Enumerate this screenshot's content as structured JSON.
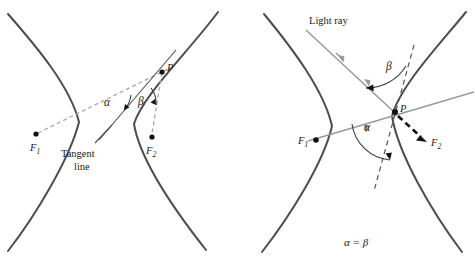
{
  "figure": {
    "width": 475,
    "height": 267,
    "background_color": "#ffffff"
  },
  "colors": {
    "curve": "#4d4d4d",
    "dashed_gray": "#a8a8a8",
    "dashed_dark": "#555555",
    "light_ray": "#9a9a9a",
    "reflected_ray": "#111111",
    "text": "#1a1a1a"
  },
  "left_panel": {
    "name": "tangent-line-diagram",
    "labels": {
      "focus1": "F",
      "focus1_sub": "1",
      "focus2": "F",
      "focus2_sub": "2",
      "point_p": "P",
      "alpha": "α",
      "beta": "β",
      "tangent_line_1": "Tangent",
      "tangent_line_2": "line"
    },
    "points": {
      "focus1": [
        36,
        134
      ],
      "focus2": [
        152,
        137
      ],
      "point_p": [
        162,
        72
      ]
    }
  },
  "right_panel": {
    "name": "light-ray-reflection-diagram",
    "labels": {
      "focus1": "F",
      "focus1_sub": "1",
      "focus2": "F",
      "focus2_sub": "2",
      "point_p": "P",
      "alpha": "α",
      "beta": "β",
      "light_ray": "Light ray",
      "caption": "α = β"
    },
    "points": {
      "focus1": [
        77,
        140
      ],
      "focus2": [
        187,
        140
      ],
      "point_p": [
        157,
        112
      ]
    }
  }
}
